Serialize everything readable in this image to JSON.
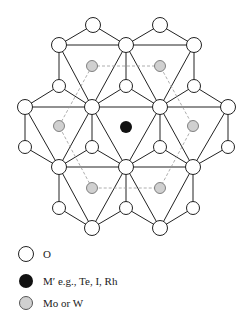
{
  "diagram": {
    "colors": {
      "oxygen_fill": "#ffffff",
      "hetero_fill": "#111111",
      "addenda_fill": "#d0d0d0",
      "line": "#222222",
      "dashed": "#999999"
    }
  },
  "legend": [
    {
      "symbol": "open-circle",
      "label": "O"
    },
    {
      "symbol": "filled-circle",
      "label": "M′ e.g., Te, I, Rh"
    },
    {
      "symbol": "stippled-circle",
      "label": "Mo or W"
    }
  ]
}
